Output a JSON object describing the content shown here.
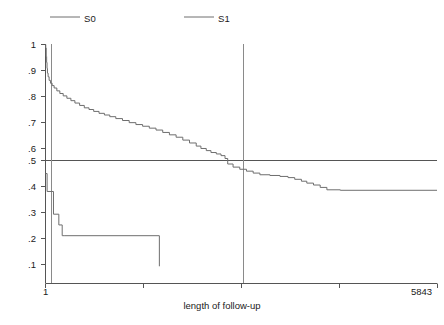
{
  "chart_data": {
    "type": "line",
    "title": "",
    "subtitle": "",
    "xlabel": "length of follow-up",
    "ylabel": "",
    "xlim": [
      1,
      5843
    ],
    "ylim": [
      0,
      1
    ],
    "grid": false,
    "legend_position": "top",
    "x_tick_labels": [
      "1",
      "5843"
    ],
    "y_tick_labels": [
      "1",
      ".9",
      ".8",
      ".7",
      ".6",
      ".5",
      ".4",
      ".3",
      ".2",
      ".1"
    ],
    "y_tick_values": [
      1,
      0.9,
      0.8,
      0.7,
      0.6,
      0.5,
      0.4,
      0.3,
      0.2,
      0.1
    ],
    "annotations": {
      "reference_line_horizontal": 0.5,
      "reference_line_vertical_x": 2720,
      "median_note": "horizontal reference at survival .5 crosses S1 near x=2720"
    },
    "series": [
      {
        "name": "S0",
        "step": true,
        "points": [
          [
            1,
            0.46
          ],
          [
            1,
            0.46
          ],
          [
            25,
            0.46
          ],
          [
            25,
            0.385
          ],
          [
            120,
            0.385
          ],
          [
            120,
            0.29
          ],
          [
            200,
            0.29
          ],
          [
            200,
            0.245
          ],
          [
            250,
            0.245
          ],
          [
            250,
            0.2
          ],
          [
            290,
            0.2
          ],
          [
            1700,
            0.2
          ],
          [
            1700,
            0.072
          ]
        ]
      },
      {
        "name": "S1",
        "step": true,
        "points": [
          [
            1,
            1.0
          ],
          [
            5,
            0.985
          ],
          [
            12,
            0.95
          ],
          [
            18,
            0.925
          ],
          [
            24,
            0.9
          ],
          [
            30,
            0.88
          ],
          [
            40,
            0.865
          ],
          [
            55,
            0.85
          ],
          [
            75,
            0.838
          ],
          [
            100,
            0.828
          ],
          [
            130,
            0.818
          ],
          [
            170,
            0.806
          ],
          [
            215,
            0.795
          ],
          [
            265,
            0.785
          ],
          [
            320,
            0.775
          ],
          [
            380,
            0.765
          ],
          [
            440,
            0.755
          ],
          [
            510,
            0.745
          ],
          [
            580,
            0.735
          ],
          [
            650,
            0.728
          ],
          [
            720,
            0.72
          ],
          [
            800,
            0.712
          ],
          [
            880,
            0.705
          ],
          [
            960,
            0.698
          ],
          [
            1050,
            0.69
          ],
          [
            1150,
            0.682
          ],
          [
            1250,
            0.673
          ],
          [
            1350,
            0.665
          ],
          [
            1450,
            0.658
          ],
          [
            1550,
            0.65
          ],
          [
            1650,
            0.642
          ],
          [
            1750,
            0.632
          ],
          [
            1850,
            0.622
          ],
          [
            1950,
            0.612
          ],
          [
            2050,
            0.6
          ],
          [
            2150,
            0.588
          ],
          [
            2250,
            0.575
          ],
          [
            2320,
            0.565
          ],
          [
            2400,
            0.556
          ],
          [
            2470,
            0.548
          ],
          [
            2550,
            0.542
          ],
          [
            2620,
            0.535
          ],
          [
            2680,
            0.523
          ],
          [
            2720,
            0.5
          ],
          [
            2800,
            0.487
          ],
          [
            2900,
            0.478
          ],
          [
            3000,
            0.47
          ],
          [
            3100,
            0.462
          ],
          [
            3200,
            0.455
          ],
          [
            3350,
            0.452
          ],
          [
            3500,
            0.448
          ],
          [
            3620,
            0.443
          ],
          [
            3720,
            0.436
          ],
          [
            3820,
            0.428
          ],
          [
            3900,
            0.42
          ],
          [
            4000,
            0.412
          ],
          [
            4100,
            0.402
          ],
          [
            4200,
            0.392
          ],
          [
            4400,
            0.39
          ],
          [
            5843,
            0.39
          ]
        ]
      }
    ],
    "legend": [
      {
        "label": "S0",
        "color": "#666666"
      },
      {
        "label": "S1",
        "color": "#666666"
      }
    ]
  },
  "axes": {
    "x_title": "length of follow-up",
    "x_min_label": "1",
    "x_max_label": "5843",
    "y_labels": [
      "1",
      ".9",
      ".8",
      ".7",
      ".6",
      ".5",
      ".4",
      ".3",
      ".2",
      ".1"
    ]
  },
  "legend": {
    "s0_label": "S0",
    "s1_label": "S1"
  },
  "colors": {
    "background": "#ffffff",
    "line": "#6e6e6e",
    "axis": "#555555",
    "text": "#1a1a1a"
  }
}
